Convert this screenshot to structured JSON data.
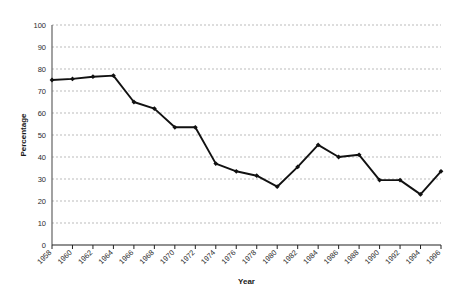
{
  "chart_data": {
    "type": "line",
    "title": "",
    "xlabel": "Year",
    "ylabel": "Percentage",
    "xlim": [
      1958,
      1996
    ],
    "ylim": [
      0,
      100
    ],
    "ytick_step": 10,
    "xtick_step": 2,
    "grid": true,
    "grid_style": "dashed-horizontal",
    "legend": "none",
    "marker": "filled-diamond",
    "line_color": "#111111",
    "grid_color": "#aaaaaa",
    "axis_color": "#555555",
    "categories": [
      "1958",
      "1960",
      "1962",
      "1964",
      "1966",
      "1968",
      "1970",
      "1972",
      "1974",
      "1976",
      "1978",
      "1980",
      "1982",
      "1984",
      "1986",
      "1988",
      "1990",
      "1992",
      "1994",
      "1996"
    ],
    "x": [
      1958,
      1960,
      1962,
      1964,
      1966,
      1968,
      1970,
      1972,
      1974,
      1976,
      1978,
      1980,
      1982,
      1984,
      1986,
      1988,
      1990,
      1992,
      1994,
      1996
    ],
    "values": [
      75,
      75.5,
      76.5,
      77,
      65,
      62,
      53.5,
      53.5,
      37,
      33.5,
      31.5,
      26.5,
      35.5,
      45.5,
      40,
      41,
      29.5,
      29.5,
      23,
      33.5
    ],
    "ytick_labels": [
      "0",
      "10",
      "20",
      "30",
      "40",
      "50",
      "60",
      "70",
      "80",
      "90",
      "100"
    ],
    "ytick_values": [
      0,
      10,
      20,
      30,
      40,
      50,
      60,
      70,
      80,
      90,
      100
    ]
  }
}
